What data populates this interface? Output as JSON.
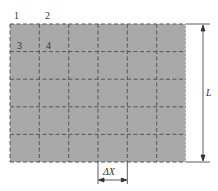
{
  "diagram": {
    "grid": {
      "columns": 6,
      "rows": 5,
      "fill_color": "#a9a9a9",
      "line_color": "#555555",
      "line_style": "dashed"
    },
    "cell_labels": [
      "1",
      "2",
      "3",
      "4"
    ],
    "dimensions": {
      "height_label": "L",
      "cell_width_label": "ΔX"
    }
  }
}
